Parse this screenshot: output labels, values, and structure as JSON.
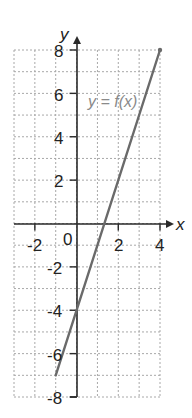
{
  "chart_data": {
    "type": "line",
    "title": "",
    "xlabel": "x",
    "ylabel": "y",
    "xlim": [
      -3,
      4
    ],
    "ylim": [
      -8,
      8
    ],
    "grid": true,
    "grid_style": "dashed",
    "x_ticks": [
      -2,
      2,
      4
    ],
    "x_tick_labels": [
      "-2",
      "2",
      "4"
    ],
    "y_ticks": [
      8,
      6,
      4,
      2,
      -2,
      -4,
      -6,
      -8
    ],
    "y_tick_labels": [
      "8",
      "6",
      "4",
      "2",
      "-2",
      "-4",
      "-6",
      "-8"
    ],
    "origin_label": "0",
    "series": [
      {
        "name": "y = f(x)",
        "equation": "y = 3x - 4",
        "x": [
          -1,
          4
        ],
        "y": [
          -7,
          8
        ]
      }
    ],
    "annotations": [
      {
        "text": "y = f(x)",
        "x": 0.7,
        "y": 5.6
      }
    ],
    "colors": {
      "grid": "#a8a8a8",
      "axis": "#2a2a2a",
      "line": "#6a6a6a",
      "label": "#8a8a8a"
    }
  },
  "labels": {
    "x_axis": "x",
    "y_axis": "y",
    "origin": "0",
    "function": "y = f(x)",
    "x_ticks": [
      "-2",
      "2",
      "4"
    ],
    "y_ticks": [
      "8",
      "6",
      "4",
      "2",
      "-2",
      "-4",
      "-6",
      "-8"
    ]
  }
}
